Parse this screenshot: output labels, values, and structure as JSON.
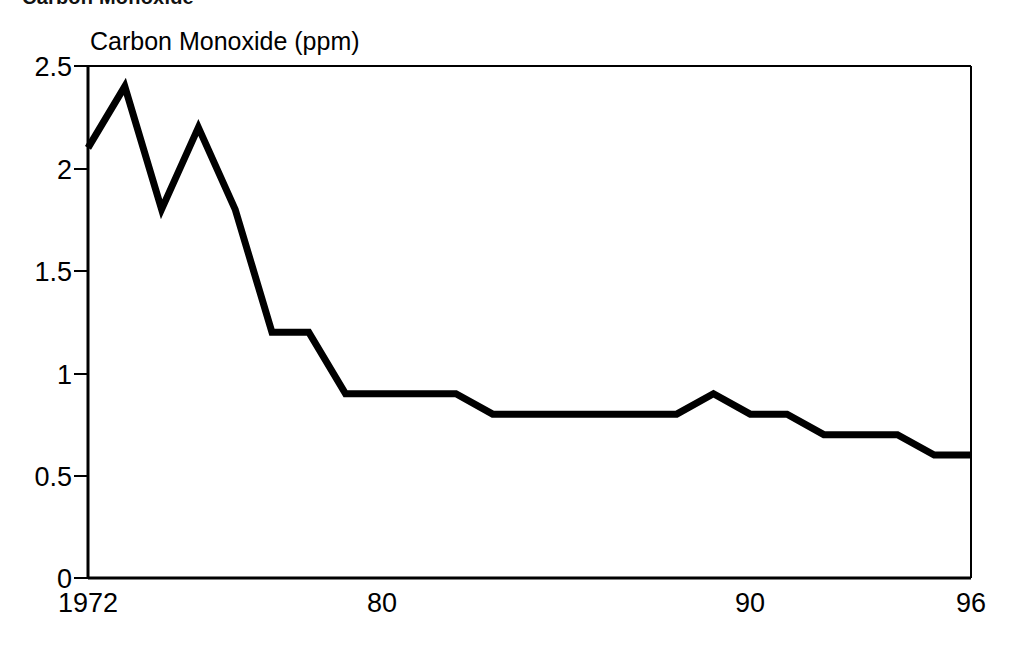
{
  "heading": {
    "text": "Carbon Monoxide",
    "note": "clipped-at-top-edge"
  },
  "axis_title": "Carbon Monoxide (ppm)",
  "chart_data": {
    "type": "line",
    "title": "Carbon Monoxide (ppm)",
    "xlabel": "",
    "ylabel": "Carbon Monoxide (ppm)",
    "x": [
      1972,
      1973,
      1974,
      1975,
      1976,
      1977,
      1978,
      1979,
      1980,
      1981,
      1982,
      1983,
      1984,
      1985,
      1986,
      1987,
      1988,
      1989,
      1990,
      1991,
      1992,
      1993,
      1994,
      1995,
      1996
    ],
    "values": [
      2.1,
      2.4,
      1.8,
      2.2,
      1.8,
      1.2,
      1.2,
      0.9,
      0.9,
      0.9,
      0.9,
      0.8,
      0.8,
      0.8,
      0.8,
      0.8,
      0.8,
      0.9,
      0.8,
      0.8,
      0.7,
      0.7,
      0.7,
      0.6,
      0.6
    ],
    "series": [
      {
        "name": "Carbon Monoxide (ppm)",
        "values": [
          2.1,
          2.4,
          1.8,
          2.2,
          1.8,
          1.2,
          1.2,
          0.9,
          0.9,
          0.9,
          0.9,
          0.8,
          0.8,
          0.8,
          0.8,
          0.8,
          0.8,
          0.9,
          0.8,
          0.8,
          0.7,
          0.7,
          0.7,
          0.6,
          0.6
        ]
      }
    ],
    "xlim": [
      1972,
      1996
    ],
    "ylim": [
      0,
      2.5
    ],
    "yticks": [
      0,
      0.5,
      1,
      1.5,
      2,
      2.5
    ],
    "ytick_labels": [
      "0",
      "0.5",
      "1",
      "1.5",
      "2",
      "2.5"
    ],
    "xticks": [
      1972,
      1980,
      1990,
      1996
    ],
    "xtick_labels": [
      "1972",
      "80",
      "90",
      "96"
    ],
    "grid": false,
    "legend": false,
    "line_color": "#000000",
    "line_width": 7,
    "axis_color": "#000000",
    "background": "#ffffff"
  },
  "yticks": [
    {
      "label": "2.5",
      "top": 52
    },
    {
      "label": "2",
      "top": 155
    },
    {
      "label": "1.5",
      "top": 257
    },
    {
      "label": "1",
      "top": 360
    },
    {
      "label": "0.5",
      "top": 462
    },
    {
      "label": "0",
      "top": 564
    }
  ],
  "xticks": [
    {
      "label": "1972",
      "left": 88
    },
    {
      "label": "80",
      "left": 382
    },
    {
      "label": "90",
      "left": 750
    },
    {
      "label": "96",
      "left": 971
    }
  ]
}
